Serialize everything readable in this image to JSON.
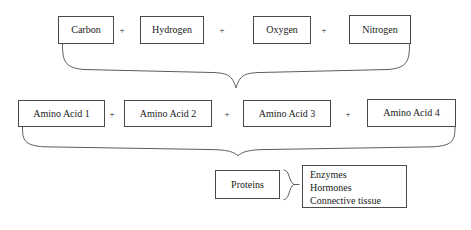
{
  "diagram": {
    "type": "flowchart",
    "background_color": "#ffffff",
    "line_color": "#4a4a4a",
    "text_color": "#1a1a1a",
    "rows": {
      "elements": {
        "label": "Chemical elements row",
        "operator": "+",
        "items": [
          {
            "label": "Carbon",
            "x": 58,
            "y": 16,
            "w": 56,
            "h": 28
          },
          {
            "label": "Hydrogen",
            "x": 140,
            "y": 16,
            "w": 64,
            "h": 28
          },
          {
            "label": "Oxygen",
            "x": 253,
            "y": 16,
            "w": 58,
            "h": 28
          },
          {
            "label": "Nitrogen",
            "x": 349,
            "y": 15,
            "w": 62,
            "h": 29
          }
        ],
        "operators": [
          {
            "label": "+",
            "x": 121,
            "y": 26
          },
          {
            "label": "+",
            "x": 221,
            "y": 26
          },
          {
            "label": "+",
            "x": 323,
            "y": 26
          }
        ]
      },
      "amino_acids": {
        "label": "Amino acids row",
        "operator": "+",
        "items": [
          {
            "label": "Amino Acid 1",
            "x": 18,
            "y": 100,
            "w": 87,
            "h": 27
          },
          {
            "label": "Amino Acid 2",
            "x": 124,
            "y": 100,
            "w": 88,
            "h": 27
          },
          {
            "label": "Amino Acid 3",
            "x": 243,
            "y": 100,
            "w": 88,
            "h": 27
          },
          {
            "label": "Amino Acid 4",
            "x": 367,
            "y": 99,
            "w": 89,
            "h": 28
          }
        ],
        "operators": [
          {
            "label": "+",
            "x": 110,
            "y": 110
          },
          {
            "label": "+",
            "x": 225,
            "y": 110
          },
          {
            "label": "+",
            "x": 345,
            "y": 110
          }
        ]
      },
      "proteins": {
        "label": "Proteins row",
        "box": {
          "label": "Proteins",
          "x": 215,
          "y": 170,
          "w": 65,
          "h": 29
        },
        "products": {
          "label": "Protein products",
          "x": 302,
          "y": 165,
          "w": 105,
          "h": 43,
          "lines": [
            "Enzymes",
            "Hormones",
            "Connective tissue"
          ]
        }
      }
    },
    "connectors": [
      {
        "name": "brace-elements-to-amino-acids",
        "orientation": "down",
        "left": 62,
        "right": 410,
        "tip_x": 236
      },
      {
        "name": "brace-amino-acids-to-proteins",
        "orientation": "down",
        "left": 22,
        "right": 455,
        "tip_x": 238
      },
      {
        "name": "brace-proteins-to-products",
        "orientation": "right",
        "x": 285,
        "top": 170,
        "bottom": 200
      }
    ]
  }
}
